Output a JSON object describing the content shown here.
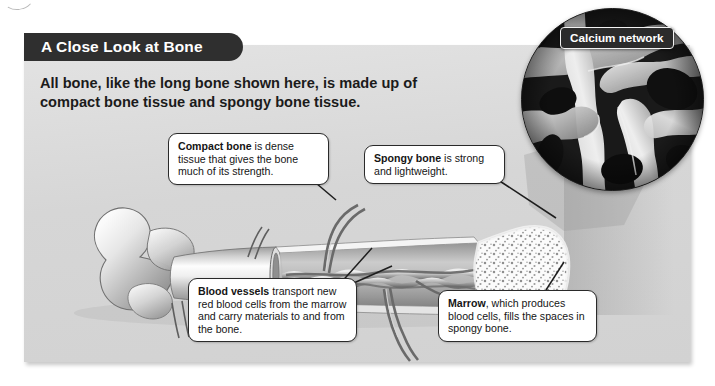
{
  "figure": {
    "title": "A Close Look at Bone",
    "intro": "All bone, like the long bone shown here, is made up of compact bone tissue and spongy bone tissue.",
    "panel_background": "#d8d8d8",
    "title_background": "#2f2f2f",
    "title_color": "#ffffff"
  },
  "inset": {
    "label": "Calcium network",
    "description": "Scanning electron micrograph of the calcium network in spongy bone",
    "label_background": "#2b2b2b",
    "label_border": "#f2f2f2"
  },
  "callouts": [
    {
      "id": "compact-bone",
      "term": "Compact bone",
      "text": " is dense tissue that gives the bone much of its strength."
    },
    {
      "id": "spongy-bone",
      "term": "Spongy bone",
      "text": " is strong and lightweight."
    },
    {
      "id": "blood-vessels",
      "term": "Blood vessels",
      "text": " transport new red blood cells from the marrow and carry materials to and from the bone."
    },
    {
      "id": "marrow",
      "term": "Marrow",
      "text": ", which produces blood cells, fills the spaces in spongy bone."
    }
  ]
}
